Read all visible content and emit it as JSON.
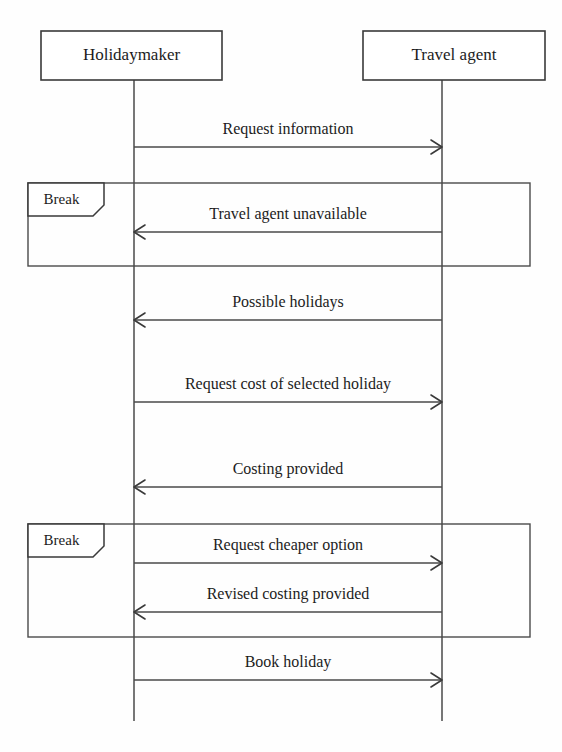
{
  "diagram": {
    "type": "uml-sequence-diagram",
    "background_color": "#fefefe",
    "line_color": "#4a4a4a",
    "text_color": "#1c1c1c"
  },
  "lifelines": [
    {
      "id": "holidaymaker",
      "label": "Holidaymaker",
      "box": {
        "x": 41,
        "y": 31,
        "w": 181,
        "h": 49
      },
      "line_x": 134,
      "line_top": 80,
      "line_bottom": 721
    },
    {
      "id": "travel-agent",
      "label": "Travel agent",
      "box": {
        "x": 363,
        "y": 31,
        "w": 182,
        "h": 49
      },
      "line_x": 442,
      "line_top": 80,
      "line_bottom": 721
    }
  ],
  "fragments": [
    {
      "id": "break-1",
      "label": "Break",
      "operator": "break",
      "x": 28,
      "y": 183,
      "w": 502,
      "h": 83,
      "tab_w": 76,
      "tab_h": 33,
      "tab_cut": 11
    },
    {
      "id": "break-2",
      "label": "Break",
      "operator": "break",
      "x": 28,
      "y": 524,
      "w": 502,
      "h": 113,
      "tab_w": 76,
      "tab_h": 33,
      "tab_cut": 11
    }
  ],
  "messages": [
    {
      "id": "msg-request-information",
      "label": "Request information",
      "from": "holidaymaker",
      "to": "travel-agent",
      "direction": "right",
      "y": 147,
      "label_y": 134
    },
    {
      "id": "msg-travel-agent-unavailable",
      "label": "Travel agent unavailable",
      "from": "travel-agent",
      "to": "holidaymaker",
      "direction": "left",
      "y": 232,
      "label_y": 219
    },
    {
      "id": "msg-possible-holidays",
      "label": "Possible holidays",
      "from": "travel-agent",
      "to": "holidaymaker",
      "direction": "left",
      "y": 320,
      "label_y": 307
    },
    {
      "id": "msg-request-cost-of-selected-holiday",
      "label": "Request cost of selected holiday",
      "from": "holidaymaker",
      "to": "travel-agent",
      "direction": "right",
      "y": 402,
      "label_y": 389
    },
    {
      "id": "msg-costing-provided",
      "label": "Costing provided",
      "from": "travel-agent",
      "to": "holidaymaker",
      "direction": "left",
      "y": 487,
      "label_y": 474
    },
    {
      "id": "msg-request-cheaper-option",
      "label": "Request cheaper option",
      "from": "holidaymaker",
      "to": "travel-agent",
      "direction": "right",
      "y": 563,
      "label_y": 550
    },
    {
      "id": "msg-revised-costing-provided",
      "label": "Revised costing provided",
      "from": "travel-agent",
      "to": "holidaymaker",
      "direction": "left",
      "y": 612,
      "label_y": 599
    },
    {
      "id": "msg-book-holiday",
      "label": "Book holiday",
      "from": "holidaymaker",
      "to": "travel-agent",
      "direction": "right",
      "y": 680,
      "label_y": 667
    }
  ]
}
